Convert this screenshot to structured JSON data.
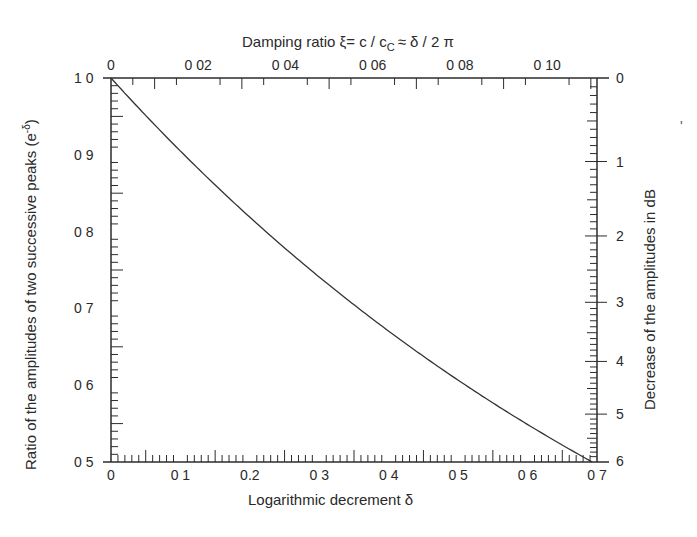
{
  "chart_data": {
    "type": "line",
    "title": "",
    "xlabel": "Logarithmic decrement δ",
    "ylabel": "Ratio of the amplitudes of two successive peaks (e^-δ)",
    "ylabel_display": "Ratio of the amplitudes of two successive peaks (e",
    "ylabel_sup": "-δ",
    "x2label": "Damping ratio  ξ = c / c_c ≈ δ / 2π",
    "x2label_parts": {
      "main": "Damping ratio   ξ= c / c",
      "sub": "C",
      "tail": "≈ δ / 2 π"
    },
    "y2label": "Decrease of the amplitudes in dB",
    "xlim": [
      0,
      0.7
    ],
    "ylim": [
      0.5,
      1.0
    ],
    "x2lim": [
      0,
      0.1114
    ],
    "y2lim": [
      0,
      6
    ],
    "x_ticks": [
      "0",
      "0 1",
      "0.2",
      "0 3",
      "0 4",
      "0 5",
      "0 6",
      "0 7"
    ],
    "x_tick_values": [
      0,
      0.1,
      0.2,
      0.3,
      0.4,
      0.5,
      0.6,
      0.7
    ],
    "x2_ticks": [
      "0",
      "0 02",
      "0 04",
      "0 06",
      "0 08",
      "0 10"
    ],
    "x2_tick_values": [
      0,
      0.02,
      0.04,
      0.06,
      0.08,
      0.1
    ],
    "y_ticks": [
      "1 0",
      "0 9",
      "0 8",
      "0 7",
      "0 6",
      "0 5"
    ],
    "y_tick_values": [
      1.0,
      0.9,
      0.8,
      0.7,
      0.6,
      0.5
    ],
    "y2_ticks": [
      "0",
      "1",
      "2",
      "3",
      "4",
      "5",
      "6"
    ],
    "y2_tick_values": [
      0,
      1,
      2,
      3,
      4,
      5,
      6
    ],
    "grid": false,
    "legend": null,
    "series": [
      {
        "name": "e^-δ",
        "x": [
          0,
          0.05,
          0.1,
          0.15,
          0.2,
          0.25,
          0.3,
          0.35,
          0.4,
          0.45,
          0.5,
          0.55,
          0.6,
          0.65,
          0.693
        ],
        "y": [
          1.0,
          0.951,
          0.905,
          0.861,
          0.819,
          0.779,
          0.741,
          0.705,
          0.67,
          0.638,
          0.607,
          0.577,
          0.549,
          0.522,
          0.5
        ]
      }
    ]
  },
  "stray_mark": "'"
}
